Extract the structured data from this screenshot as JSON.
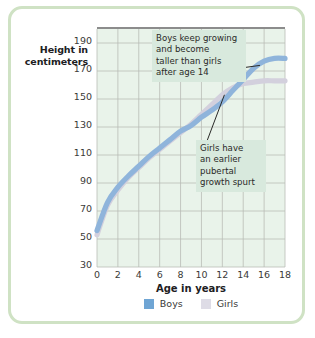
{
  "frame": {
    "border_color": "#cfe2c4",
    "background": "#ffffff"
  },
  "chart_data": {
    "type": "line",
    "title": "",
    "xlabel": "Age in years",
    "ylabel": "Height in centimeters",
    "xlim": [
      0,
      18
    ],
    "ylim": [
      30,
      200
    ],
    "xticks": [
      "0",
      "2",
      "4",
      "6",
      "8",
      "10",
      "12",
      "14",
      "16",
      "18"
    ],
    "yticks": [
      "190",
      "170",
      "150",
      "130",
      "110",
      "90",
      "70",
      "50",
      "30"
    ],
    "grid": true,
    "legend_position": "bottom",
    "plot_background": "#e9f3ea",
    "x": [
      0,
      1,
      2,
      3,
      4,
      5,
      6,
      7,
      8,
      9,
      10,
      11,
      12,
      13,
      14,
      15,
      16,
      17,
      18
    ],
    "series": [
      {
        "name": "Boys",
        "color": "#8fb4db",
        "values": [
          56,
          76,
          87,
          95,
          102,
          109,
          115,
          121,
          127,
          131,
          137,
          142,
          148,
          156,
          164,
          172,
          177,
          179,
          179
        ]
      },
      {
        "name": "Girls",
        "color": "#d3d0dd",
        "values": [
          53,
          74,
          85,
          94,
          101,
          108,
          114,
          120,
          126,
          132,
          139,
          146,
          153,
          158,
          161,
          162,
          163,
          163,
          163
        ]
      }
    ],
    "annotations": [
      {
        "id": "boys-note",
        "lines": [
          "Boys keep growing",
          "and become",
          "taller than girls",
          "after age 14"
        ],
        "text": "Boys keep growing and become taller than girls after age 14",
        "points_to": {
          "series": "Boys",
          "age": 15.6,
          "height": 174
        }
      },
      {
        "id": "girls-note",
        "lines": [
          "Girls have",
          "an earlier",
          "pubertal",
          "growth spurt"
        ],
        "text": "Girls have an earlier pubertal growth spurt",
        "points_to": {
          "series": "Girls",
          "age": 12.2,
          "height": 153
        }
      }
    ]
  },
  "legend": {
    "entries": [
      {
        "label": "Boys",
        "color": "#6fa5d4"
      },
      {
        "label": "Girls",
        "color": "#dedce6"
      }
    ]
  }
}
